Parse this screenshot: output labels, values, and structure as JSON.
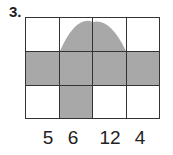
{
  "problem_number": "3.",
  "grid": {
    "rows": 3,
    "cols": 4,
    "shaded_color": "#a8a8a8",
    "line_color": "#333333",
    "shaded_cells": [
      [
        1,
        0
      ],
      [
        1,
        1
      ],
      [
        1,
        2
      ],
      [
        1,
        3
      ],
      [
        2,
        1
      ]
    ],
    "shaded_shape": "parabolic dome spanning top row columns 2-3"
  },
  "labels": [
    "5",
    "6",
    "12",
    "4"
  ]
}
